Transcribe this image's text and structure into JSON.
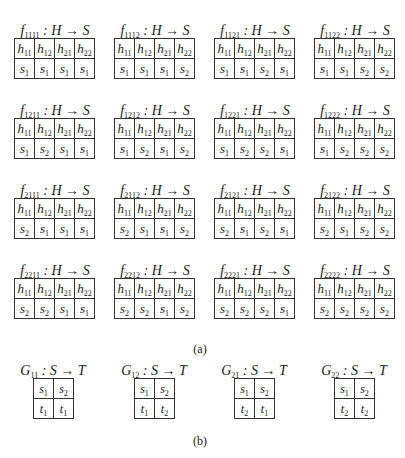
{
  "part_a": {
    "caption": "(a)",
    "functions": [
      {
        "name": "f",
        "sub": "1111",
        "map": ": H → S",
        "headers": [
          "h11",
          "h12",
          "h21",
          "h22"
        ],
        "values": [
          "s1",
          "s1",
          "s1",
          "s1"
        ]
      },
      {
        "name": "f",
        "sub": "1112",
        "map": ": H → S",
        "headers": [
          "h11",
          "h12",
          "h21",
          "h22"
        ],
        "values": [
          "s1",
          "s1",
          "s1",
          "s2"
        ]
      },
      {
        "name": "f",
        "sub": "1121",
        "map": ": H → S",
        "headers": [
          "h11",
          "h12",
          "h21",
          "h22"
        ],
        "values": [
          "s1",
          "s1",
          "s2",
          "s1"
        ]
      },
      {
        "name": "f",
        "sub": "1122",
        "map": ": H → S",
        "headers": [
          "h11",
          "h12",
          "h21",
          "h22"
        ],
        "values": [
          "s1",
          "s1",
          "s2",
          "s2"
        ]
      },
      {
        "name": "f",
        "sub": "1211",
        "map": ": H → S",
        "headers": [
          "h11",
          "h12",
          "h21",
          "h22"
        ],
        "values": [
          "s1",
          "s2",
          "s1",
          "s1"
        ]
      },
      {
        "name": "f",
        "sub": "1212",
        "map": ": H → S",
        "headers": [
          "h11",
          "h12",
          "h21",
          "h22"
        ],
        "values": [
          "s1",
          "s2",
          "s1",
          "s2"
        ]
      },
      {
        "name": "f",
        "sub": "1221",
        "map": ": H → S",
        "headers": [
          "h11",
          "h12",
          "h21",
          "h22"
        ],
        "values": [
          "s1",
          "s2",
          "s2",
          "s1"
        ]
      },
      {
        "name": "f",
        "sub": "1222",
        "map": ": H → S",
        "headers": [
          "h11",
          "h12",
          "h21",
          "h22"
        ],
        "values": [
          "s1",
          "s2",
          "s2",
          "s2"
        ]
      },
      {
        "name": "f",
        "sub": "2111",
        "map": ": H → S",
        "headers": [
          "h11",
          "h12",
          "h21",
          "h22"
        ],
        "values": [
          "s2",
          "s1",
          "s1",
          "s1"
        ]
      },
      {
        "name": "f",
        "sub": "2112",
        "map": ": H → S",
        "headers": [
          "h11",
          "h12",
          "h21",
          "h22"
        ],
        "values": [
          "s2",
          "s1",
          "s1",
          "s2"
        ]
      },
      {
        "name": "f",
        "sub": "2121",
        "map": ": H → S",
        "headers": [
          "h11",
          "h12",
          "h21",
          "h22"
        ],
        "values": [
          "s2",
          "s1",
          "s2",
          "s1"
        ]
      },
      {
        "name": "f",
        "sub": "2122",
        "map": ": H → S",
        "headers": [
          "h11",
          "h12",
          "h21",
          "h22"
        ],
        "values": [
          "s2",
          "s1",
          "s2",
          "s2"
        ]
      },
      {
        "name": "f",
        "sub": "2211",
        "map": ": H → S",
        "headers": [
          "h11",
          "h12",
          "h21",
          "h22"
        ],
        "values": [
          "s2",
          "s2",
          "s1",
          "s1"
        ]
      },
      {
        "name": "f",
        "sub": "2212",
        "map": ": H → S",
        "headers": [
          "h11",
          "h12",
          "h21",
          "h22"
        ],
        "values": [
          "s2",
          "s2",
          "s1",
          "s2"
        ]
      },
      {
        "name": "f",
        "sub": "2221",
        "map": ": H → S",
        "headers": [
          "h11",
          "h12",
          "h21",
          "h22"
        ],
        "values": [
          "s2",
          "s2",
          "s2",
          "s1"
        ]
      },
      {
        "name": "f",
        "sub": "2222",
        "map": ": H → S",
        "headers": [
          "h11",
          "h12",
          "h21",
          "h22"
        ],
        "values": [
          "s2",
          "s2",
          "s2",
          "s2"
        ]
      }
    ]
  },
  "part_b": {
    "caption": "(b)",
    "functions": [
      {
        "name": "G",
        "sub": "11",
        "map": ": S → T",
        "headers": [
          "s1",
          "s2"
        ],
        "values": [
          "t1",
          "t1"
        ]
      },
      {
        "name": "G",
        "sub": "12",
        "map": ": S → T",
        "headers": [
          "s1",
          "s2"
        ],
        "values": [
          "t1",
          "t2"
        ]
      },
      {
        "name": "G",
        "sub": "21",
        "map": ": S → T",
        "headers": [
          "s1",
          "s2"
        ],
        "values": [
          "t2",
          "t1"
        ]
      },
      {
        "name": "G",
        "sub": "22",
        "map": ": S → T",
        "headers": [
          "s1",
          "s2"
        ],
        "values": [
          "t2",
          "t2"
        ]
      }
    ]
  }
}
